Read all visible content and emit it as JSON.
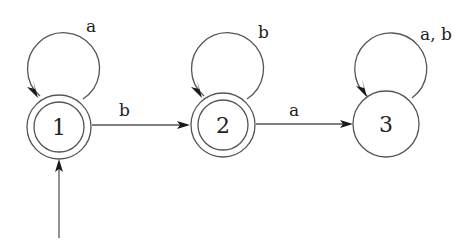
{
  "diagram": {
    "type": "finite-automaton",
    "alphabet": [
      "a",
      "b"
    ],
    "start_state": "1",
    "states": [
      {
        "id": "1",
        "label": "1",
        "accepting": true
      },
      {
        "id": "2",
        "label": "2",
        "accepting": true
      },
      {
        "id": "3",
        "label": "3",
        "accepting": false
      }
    ],
    "transitions": [
      {
        "from": "1",
        "to": "1",
        "label": "a"
      },
      {
        "from": "1",
        "to": "2",
        "label": "b"
      },
      {
        "from": "2",
        "to": "2",
        "label": "b"
      },
      {
        "from": "2",
        "to": "3",
        "label": "a"
      },
      {
        "from": "3",
        "to": "3",
        "label": "a, b"
      }
    ],
    "colors": {
      "stroke": "#555555",
      "arrowhead": "#1a1a1a",
      "text": "#222222",
      "background": "#ffffff"
    }
  }
}
